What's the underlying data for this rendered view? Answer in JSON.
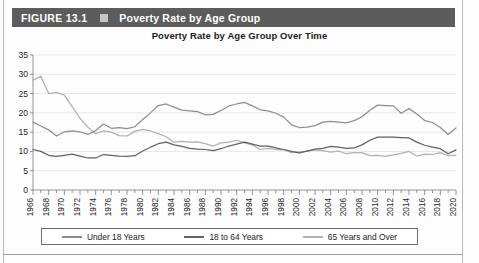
{
  "figure": {
    "number_label": "FIGURE 13.1",
    "marker_icon": "square-icon",
    "title": "Poverty Rate by Age Group"
  },
  "chart_data": {
    "type": "line",
    "title": "Poverty Rate by Age Group Over Time",
    "xlabel": "",
    "ylabel": "",
    "ylim": [
      0,
      35
    ],
    "ytick_step": 5,
    "yticks": [
      "0",
      "5",
      "10",
      "15",
      "20",
      "25",
      "30",
      "35"
    ],
    "grid": true,
    "legend_position": "bottom",
    "x_start": 1966,
    "x_end": 2020,
    "x_tick_step": 2,
    "xticks": [
      "1966",
      "1968",
      "1970",
      "1972",
      "1974",
      "1976",
      "1978",
      "1980",
      "1982",
      "1984",
      "1986",
      "1988",
      "1990",
      "1992",
      "1994",
      "1996",
      "1998",
      "2000",
      "2002",
      "2004",
      "2006",
      "2008",
      "2010",
      "2012",
      "2014",
      "2016",
      "2018",
      "2020"
    ],
    "x": [
      1966,
      1967,
      1968,
      1969,
      1970,
      1971,
      1972,
      1973,
      1974,
      1975,
      1976,
      1977,
      1978,
      1979,
      1980,
      1981,
      1982,
      1983,
      1984,
      1985,
      1986,
      1987,
      1988,
      1989,
      1990,
      1991,
      1992,
      1993,
      1994,
      1995,
      1996,
      1997,
      1998,
      1999,
      2000,
      2001,
      2002,
      2003,
      2004,
      2005,
      2006,
      2007,
      2008,
      2009,
      2010,
      2011,
      2012,
      2013,
      2014,
      2015,
      2016,
      2017,
      2018,
      2019,
      2020
    ],
    "series": [
      {
        "name": "Under 18 Years",
        "color": "#8e8e8e",
        "values": [
          17.6,
          16.6,
          15.6,
          14.0,
          15.1,
          15.3,
          15.1,
          14.4,
          15.4,
          17.1,
          16.0,
          16.2,
          15.9,
          16.4,
          18.3,
          20.0,
          21.9,
          22.3,
          21.5,
          20.7,
          20.5,
          20.3,
          19.5,
          19.6,
          20.6,
          21.8,
          22.3,
          22.7,
          21.8,
          20.8,
          20.5,
          19.9,
          18.9,
          16.9,
          16.2,
          16.3,
          16.7,
          17.6,
          17.8,
          17.6,
          17.4,
          18.0,
          19.0,
          20.7,
          22.0,
          21.9,
          21.8,
          19.9,
          21.1,
          19.7,
          18.0,
          17.5,
          16.2,
          14.4,
          16.1
        ]
      },
      {
        "name": "18 to 64 Years",
        "color": "#616161",
        "values": [
          10.5,
          10.0,
          9.0,
          8.7,
          9.0,
          9.3,
          8.8,
          8.3,
          8.3,
          9.2,
          9.0,
          8.8,
          8.7,
          8.9,
          10.1,
          11.1,
          12.0,
          12.4,
          11.7,
          11.3,
          10.8,
          10.6,
          10.5,
          10.2,
          10.7,
          11.4,
          11.9,
          12.4,
          11.9,
          11.4,
          11.4,
          10.9,
          10.5,
          10.0,
          9.6,
          10.1,
          10.6,
          10.8,
          11.3,
          11.1,
          10.8,
          10.9,
          11.7,
          12.9,
          13.7,
          13.7,
          13.7,
          13.6,
          13.5,
          12.4,
          11.6,
          11.1,
          10.7,
          9.4,
          10.4
        ]
      },
      {
        "name": "65 Years and Over",
        "color": "#b0b0b0",
        "values": [
          28.5,
          29.5,
          25.0,
          25.3,
          24.6,
          21.6,
          18.6,
          16.3,
          14.6,
          15.3,
          15.0,
          14.1,
          14.0,
          15.2,
          15.7,
          15.3,
          14.6,
          13.8,
          12.4,
          12.6,
          12.4,
          12.5,
          12.0,
          11.4,
          12.2,
          12.4,
          12.9,
          12.2,
          11.7,
          10.5,
          10.8,
          10.5,
          10.5,
          9.7,
          9.9,
          10.1,
          10.4,
          10.2,
          9.8,
          10.1,
          9.4,
          9.7,
          9.7,
          8.9,
          9.0,
          8.7,
          9.1,
          9.5,
          10.0,
          8.8,
          9.3,
          9.2,
          9.7,
          8.9,
          9.0
        ]
      }
    ]
  },
  "legend": {
    "items": [
      {
        "label": "Under 18 Years",
        "color": "#8e8e8e"
      },
      {
        "label": "18 to 64 Years",
        "color": "#616161"
      },
      {
        "label": "65 Years and Over",
        "color": "#b0b0b0"
      }
    ]
  }
}
